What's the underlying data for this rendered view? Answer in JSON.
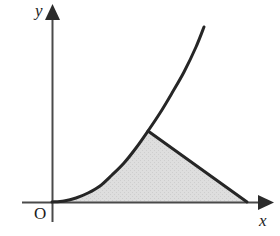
{
  "figure": {
    "background_color": "#ffffff",
    "width": 280,
    "height": 236
  },
  "labels": {
    "y_axis": "y",
    "x_axis": "x",
    "origin": "O"
  },
  "icons": {
    "y_arrow": "arrow-up-icon",
    "x_arrow": "arrow-right-icon"
  },
  "colors": {
    "stroke": "#262626",
    "axis": "#4a4a4a",
    "shade_fill": "#dcdcdc",
    "shade_fill_dither": "#cfcfcf",
    "text": "#1c1c1c",
    "background": "#ffffff"
  },
  "chart_data": {
    "type": "line",
    "title": "",
    "xlabel": "x",
    "ylabel": "y",
    "grid": false,
    "legend": "none",
    "origin_px": {
      "x": 52,
      "y": 202
    },
    "axes": {
      "x_axis": {
        "x_start_px": 22,
        "x_end_px": 270,
        "y_px": 202,
        "arrow": "right"
      },
      "y_axis": {
        "y_start_px": 5,
        "y_end_px": 222,
        "x_px": 52,
        "arrow": "up"
      }
    },
    "series": [
      {
        "name": "exponential-curve",
        "description": "Convex increasing curve rising from the origin",
        "stroke_width_px": 3,
        "points_px": [
          {
            "x": 52,
            "y": 202
          },
          {
            "x": 64,
            "y": 201
          },
          {
            "x": 76,
            "y": 198
          },
          {
            "x": 88,
            "y": 193
          },
          {
            "x": 100,
            "y": 186
          },
          {
            "x": 112,
            "y": 175
          },
          {
            "x": 124,
            "y": 163
          },
          {
            "x": 136,
            "y": 148
          },
          {
            "x": 148,
            "y": 131
          },
          {
            "x": 160,
            "y": 113
          },
          {
            "x": 172,
            "y": 93
          },
          {
            "x": 184,
            "y": 72
          },
          {
            "x": 196,
            "y": 47
          },
          {
            "x": 204,
            "y": 27
          }
        ]
      },
      {
        "name": "descending-line",
        "description": "Straight segment from the curve vertex down to the x-axis",
        "stroke_width_px": 3,
        "points_px": [
          {
            "x": 148,
            "y": 131
          },
          {
            "x": 247,
            "y": 202
          }
        ]
      }
    ],
    "shaded_region": {
      "name": "bounded-area",
      "fill": "#dcdcdc",
      "boundaries": [
        "exponential-curve",
        "descending-line",
        "x-axis"
      ],
      "vertices_px": [
        {
          "x": 52,
          "y": 202
        },
        {
          "x": 148,
          "y": 131
        },
        {
          "x": 247,
          "y": 202
        }
      ]
    },
    "annotations": [
      {
        "name": "intersection-vertex",
        "x_px": 148,
        "y_px": 131,
        "label": ""
      },
      {
        "name": "line-x-intercept",
        "x_px": 247,
        "y_px": 202,
        "label": ""
      },
      {
        "name": "curve-upper-end",
        "x_px": 204,
        "y_px": 27,
        "label": ""
      }
    ]
  }
}
